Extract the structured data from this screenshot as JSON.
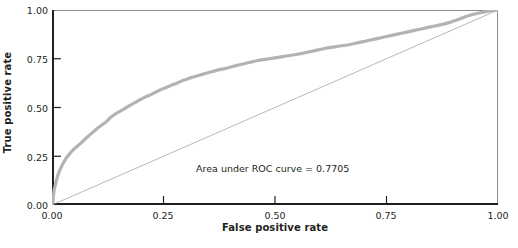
{
  "chart_data": {
    "type": "line",
    "title": "",
    "subtitle": "",
    "xlabel": "False positive rate",
    "ylabel": "True positive rate",
    "xlim": [
      0.0,
      1.0
    ],
    "ylim": [
      0.0,
      1.0
    ],
    "grid": false,
    "legend": null,
    "annotations": [
      {
        "name": "auc-annotation",
        "text": "Area under ROC curve = 0.7705",
        "x": 0.47,
        "y": 0.27
      }
    ],
    "xticks": [
      0.0,
      0.25,
      0.5,
      0.75,
      1.0
    ],
    "xtick_labels": [
      "0.00",
      "0.25",
      "0.50",
      "0.75",
      "1.00"
    ],
    "yticks": [
      0.0,
      0.25,
      0.5,
      0.75,
      1.0
    ],
    "ytick_labels": [
      "0.00",
      "0.25",
      "0.50",
      "0.75",
      "1.00"
    ],
    "auc": 0.7705,
    "series": [
      {
        "name": "ROC curve",
        "color": "#b3b3b3",
        "width": 3.2,
        "points": [
          [
            0.0,
            0.0
          ],
          [
            0.002,
            0.018
          ],
          [
            0.003,
            0.04
          ],
          [
            0.004,
            0.062
          ],
          [
            0.005,
            0.08
          ],
          [
            0.007,
            0.098
          ],
          [
            0.009,
            0.118
          ],
          [
            0.011,
            0.136
          ],
          [
            0.013,
            0.152
          ],
          [
            0.016,
            0.17
          ],
          [
            0.019,
            0.186
          ],
          [
            0.022,
            0.2
          ],
          [
            0.025,
            0.214
          ],
          [
            0.028,
            0.226
          ],
          [
            0.031,
            0.238
          ],
          [
            0.035,
            0.25
          ],
          [
            0.039,
            0.262
          ],
          [
            0.043,
            0.272
          ],
          [
            0.047,
            0.282
          ],
          [
            0.052,
            0.292
          ],
          [
            0.056,
            0.3
          ],
          [
            0.06,
            0.308
          ],
          [
            0.064,
            0.316
          ],
          [
            0.069,
            0.326
          ],
          [
            0.073,
            0.336
          ],
          [
            0.078,
            0.346
          ],
          [
            0.083,
            0.356
          ],
          [
            0.088,
            0.366
          ],
          [
            0.093,
            0.376
          ],
          [
            0.098,
            0.386
          ],
          [
            0.103,
            0.396
          ],
          [
            0.108,
            0.404
          ],
          [
            0.113,
            0.412
          ],
          [
            0.118,
            0.42
          ],
          [
            0.123,
            0.43
          ],
          [
            0.128,
            0.442
          ],
          [
            0.133,
            0.452
          ],
          [
            0.138,
            0.46
          ],
          [
            0.143,
            0.468
          ],
          [
            0.149,
            0.476
          ],
          [
            0.155,
            0.484
          ],
          [
            0.161,
            0.492
          ],
          [
            0.167,
            0.5
          ],
          [
            0.173,
            0.508
          ],
          [
            0.179,
            0.516
          ],
          [
            0.185,
            0.524
          ],
          [
            0.191,
            0.532
          ],
          [
            0.197,
            0.54
          ],
          [
            0.204,
            0.548
          ],
          [
            0.211,
            0.556
          ],
          [
            0.218,
            0.562
          ],
          [
            0.225,
            0.57
          ],
          [
            0.232,
            0.578
          ],
          [
            0.239,
            0.586
          ],
          [
            0.246,
            0.594
          ],
          [
            0.253,
            0.6
          ],
          [
            0.261,
            0.608
          ],
          [
            0.269,
            0.616
          ],
          [
            0.277,
            0.622
          ],
          [
            0.285,
            0.63
          ],
          [
            0.293,
            0.638
          ],
          [
            0.301,
            0.644
          ],
          [
            0.31,
            0.652
          ],
          [
            0.319,
            0.658
          ],
          [
            0.328,
            0.664
          ],
          [
            0.337,
            0.67
          ],
          [
            0.346,
            0.676
          ],
          [
            0.355,
            0.682
          ],
          [
            0.365,
            0.688
          ],
          [
            0.375,
            0.694
          ],
          [
            0.385,
            0.698
          ],
          [
            0.395,
            0.704
          ],
          [
            0.405,
            0.71
          ],
          [
            0.415,
            0.716
          ],
          [
            0.426,
            0.722
          ],
          [
            0.437,
            0.728
          ],
          [
            0.448,
            0.734
          ],
          [
            0.459,
            0.74
          ],
          [
            0.47,
            0.744
          ],
          [
            0.481,
            0.748
          ],
          [
            0.492,
            0.752
          ],
          [
            0.503,
            0.756
          ],
          [
            0.514,
            0.76
          ],
          [
            0.525,
            0.764
          ],
          [
            0.536,
            0.768
          ],
          [
            0.547,
            0.772
          ],
          [
            0.558,
            0.776
          ],
          [
            0.57,
            0.782
          ],
          [
            0.582,
            0.788
          ],
          [
            0.594,
            0.794
          ],
          [
            0.606,
            0.8
          ],
          [
            0.618,
            0.806
          ],
          [
            0.63,
            0.81
          ],
          [
            0.642,
            0.814
          ],
          [
            0.654,
            0.818
          ],
          [
            0.666,
            0.822
          ],
          [
            0.678,
            0.828
          ],
          [
            0.69,
            0.834
          ],
          [
            0.702,
            0.84
          ],
          [
            0.714,
            0.846
          ],
          [
            0.726,
            0.852
          ],
          [
            0.738,
            0.858
          ],
          [
            0.75,
            0.864
          ],
          [
            0.762,
            0.87
          ],
          [
            0.774,
            0.876
          ],
          [
            0.786,
            0.882
          ],
          [
            0.798,
            0.888
          ],
          [
            0.81,
            0.894
          ],
          [
            0.822,
            0.9
          ],
          [
            0.834,
            0.906
          ],
          [
            0.846,
            0.912
          ],
          [
            0.858,
            0.918
          ],
          [
            0.87,
            0.924
          ],
          [
            0.882,
            0.93
          ],
          [
            0.894,
            0.938
          ],
          [
            0.906,
            0.948
          ],
          [
            0.918,
            0.958
          ],
          [
            0.93,
            0.968
          ],
          [
            0.945,
            0.978
          ],
          [
            0.96,
            0.986
          ],
          [
            0.975,
            0.993
          ],
          [
            0.99,
            0.998
          ],
          [
            1.0,
            1.0
          ]
        ]
      },
      {
        "name": "Reference diagonal",
        "color": "#9a9a9a",
        "width": 0.7,
        "points": [
          [
            0.0,
            0.0
          ],
          [
            1.0,
            1.0
          ]
        ]
      }
    ]
  },
  "figure": {
    "caption_sliver": ""
  }
}
